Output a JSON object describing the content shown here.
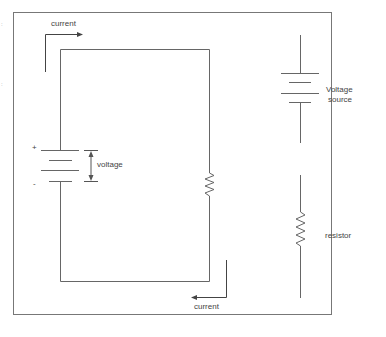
{
  "diagram": {
    "type": "circuit-schematic",
    "colors": {
      "line": "#666666",
      "frame": "#777777",
      "text": "#444444",
      "background": "#ffffff"
    },
    "circuit": {
      "components": [
        {
          "type": "battery",
          "label": "voltage",
          "plus_sign": "+",
          "minus_sign": "-"
        },
        {
          "type": "resistor",
          "label": ""
        }
      ],
      "current_labels": {
        "top": "current",
        "bottom": "current"
      },
      "voltage_label": "voltage",
      "plus_sign": "+",
      "minus_sign": "-"
    },
    "legend": {
      "items": [
        {
          "symbol": "battery-icon",
          "label_line1": "Voltage",
          "label_line2": "source"
        },
        {
          "symbol": "resistor-icon",
          "label": "resistor"
        }
      ]
    },
    "edge_marks": [
      ":",
      ":"
    ]
  }
}
